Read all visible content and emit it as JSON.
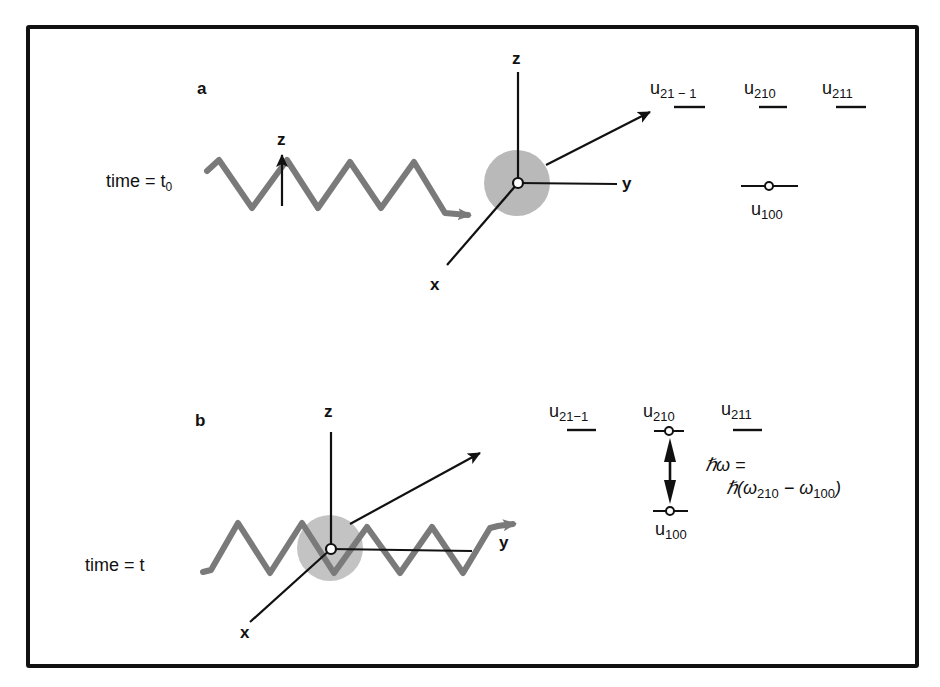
{
  "panels": {
    "a": {
      "label": "a",
      "time_label": "time = t",
      "time_sub": "0",
      "axes": {
        "z": "z",
        "y": "y",
        "x": "x"
      },
      "wave_polarization_label": "z",
      "states": {
        "u21m1": {
          "base": "u",
          "sub": "21 − 1"
        },
        "u210": {
          "base": "u",
          "sub": "210"
        },
        "u211": {
          "base": "u",
          "sub": "211"
        },
        "u100": {
          "base": "u",
          "sub": "100"
        }
      }
    },
    "b": {
      "label": "b",
      "time_label": "time = t",
      "axes": {
        "z": "z",
        "y": "y",
        "x": "x"
      },
      "states": {
        "u21m1": {
          "base": "u",
          "sub": "21−1"
        },
        "u210": {
          "base": "u",
          "sub": "210"
        },
        "u211": {
          "base": "u",
          "sub": "211"
        },
        "u100": {
          "base": "u",
          "sub": "100"
        }
      },
      "energy": {
        "line1": "ℏω =",
        "line2_prefix": "ℏ(ω",
        "line2_sub1": "210",
        "line2_mid": " − ω",
        "line2_sub2": "100",
        "line2_suffix": ")"
      }
    }
  },
  "colors": {
    "ink": "#111111",
    "wave": "#7a7a7a",
    "atom": "#b9b9b9",
    "border": "#111111"
  }
}
